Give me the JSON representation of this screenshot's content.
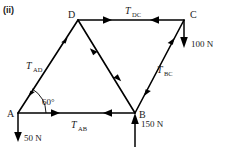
{
  "figure": {
    "label": "(ii)",
    "type": "truss-force-diagram"
  },
  "nodes": [
    {
      "id": "A",
      "label": "A",
      "x": 18,
      "y": 113
    },
    {
      "id": "B",
      "label": "B",
      "x": 135,
      "y": 113
    },
    {
      "id": "C",
      "label": "C",
      "x": 184,
      "y": 20
    },
    {
      "id": "D",
      "label": "D",
      "x": 78,
      "y": 20
    }
  ],
  "members": [
    {
      "id": "AD",
      "label": "T",
      "subscript": "AD",
      "from": "A",
      "to": "D",
      "arrows": "outward"
    },
    {
      "id": "DC",
      "label": "T",
      "subscript": "DC",
      "from": "D",
      "to": "C",
      "arrows": "inward"
    },
    {
      "id": "DB",
      "label": "",
      "subscript": "",
      "from": "D",
      "to": "B",
      "arrows": "inward"
    },
    {
      "id": "BC",
      "label": "T",
      "subscript": "BC",
      "from": "B",
      "to": "C",
      "arrows": "outward"
    },
    {
      "id": "AB",
      "label": "T",
      "subscript": "AB",
      "from": "A",
      "to": "B",
      "arrows": "inward"
    }
  ],
  "loads": [
    {
      "id": "load-A",
      "value": "50 N",
      "at": "A",
      "direction": "down"
    },
    {
      "id": "load-B",
      "value": "150 N",
      "at": "B",
      "direction": "up"
    },
    {
      "id": "load-C",
      "value": "100 N",
      "at": "C",
      "direction": "down"
    }
  ],
  "angle": {
    "value": "60",
    "unit": "°",
    "text": "60°",
    "at": "A",
    "between": "AB and AD"
  },
  "colors": {
    "ink": "#000000",
    "background": "#ffffff"
  }
}
